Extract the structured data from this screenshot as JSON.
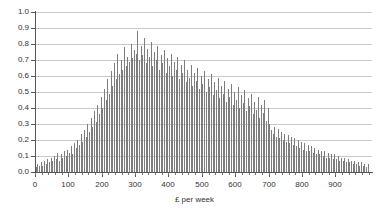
{
  "chart_data": {
    "type": "bar",
    "title": "",
    "subtitle": "",
    "xlabel": "£ per week",
    "ylabel": "",
    "xlim": [
      0,
      1010
    ],
    "ylim": [
      0.0,
      1.0
    ],
    "grid": true,
    "legend": null,
    "bin_width": 5,
    "y_ticks": [
      "1.0",
      "0.9",
      "0.8",
      "0.7",
      "0.6",
      "0.5",
      "0.4",
      "0.3",
      "0.2",
      "0.1",
      "0.0"
    ],
    "y_tick_values": [
      1.0,
      0.9,
      0.8,
      0.7,
      0.6,
      0.5,
      0.4,
      0.3,
      0.2,
      0.1,
      0.0
    ],
    "x_ticks": [
      "0",
      "100",
      "200",
      "300",
      "400",
      "500",
      "600",
      "700",
      "800",
      "900"
    ],
    "x_tick_values": [
      0,
      100,
      200,
      300,
      400,
      500,
      600,
      700,
      800,
      900
    ],
    "colors": {
      "bar": "#7d7d7d",
      "gridline": "#c9c9c9",
      "axis": "#555555",
      "background": "#ffffff",
      "text": "#333333"
    },
    "x": [
      2,
      7,
      12,
      17,
      22,
      27,
      32,
      37,
      42,
      47,
      52,
      57,
      62,
      67,
      72,
      77,
      82,
      87,
      92,
      97,
      102,
      107,
      112,
      117,
      122,
      127,
      132,
      137,
      142,
      147,
      152,
      157,
      162,
      167,
      172,
      177,
      182,
      187,
      192,
      197,
      202,
      207,
      212,
      217,
      222,
      227,
      232,
      237,
      242,
      247,
      252,
      257,
      262,
      267,
      272,
      277,
      282,
      287,
      292,
      297,
      302,
      307,
      312,
      317,
      322,
      327,
      332,
      337,
      342,
      347,
      352,
      357,
      362,
      367,
      372,
      377,
      382,
      387,
      392,
      397,
      402,
      407,
      412,
      417,
      422,
      427,
      432,
      437,
      442,
      447,
      452,
      457,
      462,
      467,
      472,
      477,
      482,
      487,
      492,
      497,
      502,
      507,
      512,
      517,
      522,
      527,
      532,
      537,
      542,
      547,
      552,
      557,
      562,
      567,
      572,
      577,
      582,
      587,
      592,
      597,
      602,
      607,
      612,
      617,
      622,
      627,
      632,
      637,
      642,
      647,
      652,
      657,
      662,
      667,
      672,
      677,
      682,
      687,
      692,
      697,
      702,
      707,
      712,
      717,
      722,
      727,
      732,
      737,
      742,
      747,
      752,
      757,
      762,
      767,
      772,
      777,
      782,
      787,
      792,
      797,
      802,
      807,
      812,
      817,
      822,
      827,
      832,
      837,
      842,
      847,
      852,
      857,
      862,
      867,
      872,
      877,
      882,
      887,
      892,
      897,
      902,
      907,
      912,
      917,
      922,
      927,
      932,
      937,
      942,
      947,
      952,
      957,
      962,
      967,
      972,
      977,
      982,
      987,
      992,
      997
    ],
    "values": [
      0.03,
      0.05,
      0.04,
      0.06,
      0.04,
      0.07,
      0.05,
      0.08,
      0.06,
      0.09,
      0.07,
      0.1,
      0.08,
      0.12,
      0.07,
      0.11,
      0.09,
      0.13,
      0.1,
      0.14,
      0.12,
      0.16,
      0.11,
      0.18,
      0.15,
      0.2,
      0.17,
      0.24,
      0.19,
      0.26,
      0.22,
      0.3,
      0.25,
      0.34,
      0.28,
      0.38,
      0.31,
      0.42,
      0.36,
      0.47,
      0.4,
      0.52,
      0.45,
      0.58,
      0.49,
      0.63,
      0.54,
      0.68,
      0.58,
      0.74,
      0.61,
      0.7,
      0.64,
      0.78,
      0.66,
      0.72,
      0.69,
      0.8,
      0.71,
      0.76,
      0.74,
      0.88,
      0.7,
      0.79,
      0.73,
      0.84,
      0.68,
      0.77,
      0.72,
      0.81,
      0.66,
      0.75,
      0.7,
      0.79,
      0.64,
      0.73,
      0.68,
      0.76,
      0.62,
      0.71,
      0.66,
      0.74,
      0.6,
      0.69,
      0.64,
      0.72,
      0.58,
      0.67,
      0.62,
      0.7,
      0.56,
      0.64,
      0.59,
      0.67,
      0.54,
      0.62,
      0.57,
      0.65,
      0.52,
      0.6,
      0.55,
      0.63,
      0.5,
      0.58,
      0.53,
      0.61,
      0.48,
      0.56,
      0.51,
      0.59,
      0.46,
      0.54,
      0.49,
      0.57,
      0.44,
      0.52,
      0.47,
      0.55,
      0.42,
      0.5,
      0.45,
      0.53,
      0.4,
      0.48,
      0.43,
      0.51,
      0.38,
      0.46,
      0.41,
      0.49,
      0.36,
      0.44,
      0.39,
      0.47,
      0.34,
      0.42,
      0.37,
      0.45,
      0.32,
      0.4,
      0.3,
      0.26,
      0.24,
      0.28,
      0.22,
      0.27,
      0.21,
      0.25,
      0.2,
      0.24,
      0.19,
      0.23,
      0.18,
      0.22,
      0.17,
      0.21,
      0.16,
      0.2,
      0.15,
      0.19,
      0.14,
      0.18,
      0.13,
      0.17,
      0.13,
      0.16,
      0.12,
      0.15,
      0.11,
      0.14,
      0.11,
      0.13,
      0.1,
      0.13,
      0.09,
      0.12,
      0.09,
      0.11,
      0.08,
      0.11,
      0.08,
      0.1,
      0.07,
      0.09,
      0.07,
      0.09,
      0.06,
      0.08,
      0.06,
      0.07,
      0.05,
      0.07,
      0.05,
      0.06,
      0.04,
      0.06,
      0.04,
      0.05,
      0.03,
      0.05
    ]
  }
}
